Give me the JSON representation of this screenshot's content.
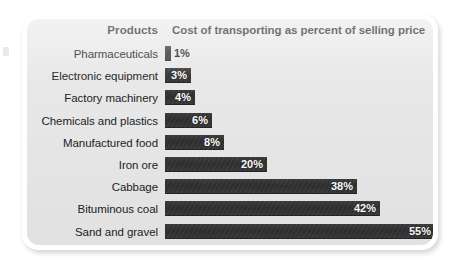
{
  "chart_data": {
    "type": "bar",
    "orientation": "horizontal",
    "title": "",
    "column_headers": {
      "category": "Products",
      "value": "Cost of transporting as percent of selling price"
    },
    "xlabel": "",
    "ylabel": "",
    "unit": "%",
    "xlim": [
      0,
      55
    ],
    "grid": false,
    "legend": false,
    "bar_color": "#333333",
    "background_color": "#e8e8e8",
    "label_color": "#232323",
    "categories": [
      "Pharmaceuticals",
      "Electronic equipment",
      "Factory machinery",
      "Chemicals and plastics",
      "Manufactured food",
      "Iron ore",
      "Cabbage",
      "Bituminous coal",
      "Sand and gravel"
    ],
    "values": [
      1,
      3,
      4,
      6,
      8,
      20,
      38,
      42,
      55
    ],
    "value_labels": [
      "1%",
      "3%",
      "4%",
      "6%",
      "8%",
      "20%",
      "38%",
      "42%",
      "55%"
    ],
    "label_placement": [
      "outside",
      "inside",
      "inside",
      "inside",
      "inside",
      "inside",
      "inside",
      "inside",
      "inside"
    ],
    "bar_pixel_widths": [
      6,
      26,
      30,
      47,
      59,
      102,
      192,
      215,
      270
    ]
  }
}
